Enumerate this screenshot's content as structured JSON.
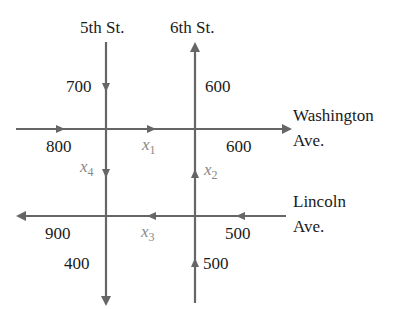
{
  "colors": {
    "road": "#666666",
    "text": "#1a1a1a",
    "variable": "#888888",
    "background": "#ffffff"
  },
  "streets": {
    "fifth": {
      "label": "5th St.",
      "direction": "south"
    },
    "sixth": {
      "label": "6th St.",
      "direction": "north"
    }
  },
  "avenues": {
    "washington": {
      "label_line1": "Washington",
      "label_line2": "Ave.",
      "direction": "east"
    },
    "lincoln": {
      "label_line1": "Lincoln",
      "label_line2": "Ave.",
      "direction": "west"
    }
  },
  "flows": {
    "fifth_in_north": "700",
    "sixth_out_north": "600",
    "washington_in_west": "800",
    "washington_out_east": "600",
    "lincoln_out_west": "900",
    "lincoln_in_east": "500",
    "fifth_out_south": "400",
    "sixth_in_south": "500"
  },
  "variables": {
    "x1": {
      "base": "x",
      "sub": "1",
      "segment": "Washington Ave. between 5th and 6th, eastbound"
    },
    "x2": {
      "base": "x",
      "sub": "2",
      "segment": "6th St. between Lincoln and Washington, northbound"
    },
    "x3": {
      "base": "x",
      "sub": "3",
      "segment": "Lincoln Ave. between 6th and 5th, westbound"
    },
    "x4": {
      "base": "x",
      "sub": "4",
      "segment": "5th St. between Washington and Lincoln, southbound"
    }
  }
}
